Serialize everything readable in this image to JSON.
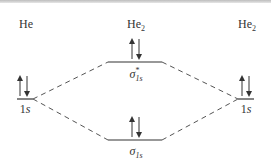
{
  "diagram": {
    "type": "molecular-orbital-diagram",
    "headers": {
      "left": {
        "base": "He",
        "sub": ""
      },
      "center": {
        "base": "He",
        "sub": "2"
      },
      "right": {
        "base": "He",
        "sub": "2"
      }
    },
    "levels": {
      "left_atomic": {
        "label_num": "1",
        "label_s": "s",
        "electrons": "up-down"
      },
      "right_atomic": {
        "label_num": "1",
        "label_s": "s",
        "electrons": "up-down"
      },
      "antibonding": {
        "symbol": "σ",
        "sup": "*",
        "sub": "1s",
        "electrons": "up-down"
      },
      "bonding": {
        "symbol": "σ",
        "sub": "1s",
        "electrons": "up-down"
      }
    },
    "colors": {
      "line": "#333333",
      "dash": "#555555",
      "topbar": "#c8c8c8"
    }
  }
}
